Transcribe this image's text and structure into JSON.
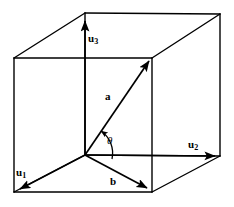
{
  "figure": {
    "background_color": "#ffffff",
    "stroke_color": "#000000",
    "width": 234,
    "height": 207
  },
  "labels": {
    "u1": {
      "text": "u",
      "subscript": "1",
      "name": "basis-vector-u1"
    },
    "u2": {
      "text": "u",
      "subscript": "2",
      "name": "basis-vector-u2"
    },
    "u3": {
      "text": "u",
      "subscript": "3",
      "name": "basis-vector-u3"
    },
    "a": {
      "text": "a",
      "name": "vector-a"
    },
    "b": {
      "text": "b",
      "name": "vector-b"
    },
    "theta": {
      "text": "θ",
      "name": "angle-theta"
    }
  },
  "geometry": {
    "origin": [
      85,
      155
    ],
    "cube_vertices": {
      "front_bottom_left": [
        14,
        192
      ],
      "front_bottom_right": [
        152,
        192
      ],
      "front_top_left": [
        14,
        58
      ],
      "front_top_right": [
        152,
        58
      ],
      "back_bottom_left": [
        85,
        155
      ],
      "back_bottom_right": [
        220,
        156
      ],
      "back_top_left": [
        85,
        13
      ],
      "back_top_right": [
        220,
        14
      ]
    },
    "vectors": {
      "u1": {
        "from": [
          85,
          155
        ],
        "to": [
          18,
          190
        ]
      },
      "u2": {
        "from": [
          85,
          155
        ],
        "to": [
          216,
          156
        ]
      },
      "u3": {
        "from": [
          85,
          155
        ],
        "to": [
          85,
          19
        ]
      },
      "a": {
        "from": [
          85,
          155
        ],
        "to": [
          150,
          60
        ]
      },
      "b": {
        "from": [
          85,
          155
        ],
        "to": [
          148,
          189
        ]
      }
    },
    "angle_arc": {
      "center": [
        85,
        155
      ],
      "radius": 27,
      "from_vector": "b",
      "to_vector": "a"
    }
  },
  "colors": {
    "line": "#000000",
    "background": "#ffffff"
  }
}
